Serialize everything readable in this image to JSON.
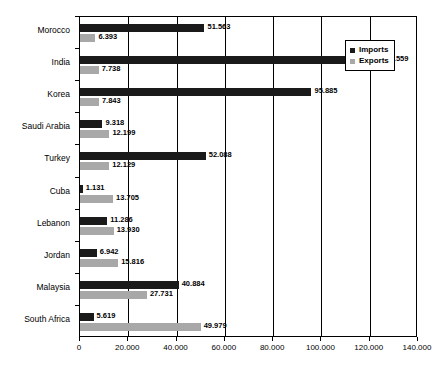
{
  "chart_data": {
    "type": "bar",
    "orientation": "horizontal",
    "title": "",
    "xlabel": "",
    "ylabel": "",
    "xlim": [
      0,
      140000
    ],
    "xticks": [
      0,
      20000,
      40000,
      60000,
      80000,
      100000,
      120000,
      140000
    ],
    "xtick_labels": [
      "0",
      "20.000",
      "40.000",
      "60.000",
      "80.000",
      "100.000",
      "120.000",
      "140.000"
    ],
    "grid": true,
    "legend_position": "top-right",
    "categories": [
      "Morocco",
      "India",
      "Korea",
      "Saudi Arabia",
      "Turkey",
      "Cuba",
      "Lebanon",
      "Jordan",
      "Malaysia",
      "South Africa"
    ],
    "series": [
      {
        "name": "Imports",
        "color": "#1a1a1a",
        "values": [
          51563,
          123559,
          95885,
          9318,
          52088,
          1131,
          11286,
          6942,
          40884,
          5619
        ],
        "labels": [
          "51.563",
          "123.559",
          "95.885",
          "9.318",
          "52.088",
          "1.131",
          "11.286",
          "6.942",
          "40.884",
          "5.619"
        ]
      },
      {
        "name": "Exports",
        "color": "#a8a8a8",
        "values": [
          6393,
          7738,
          7843,
          12199,
          12129,
          13705,
          13930,
          15816,
          27731,
          49979
        ],
        "labels": [
          "6.393",
          "7.738",
          "7.843",
          "12.199",
          "12.129",
          "13.705",
          "13.930",
          "15.816",
          "27.731",
          "49.979"
        ]
      }
    ]
  },
  "legend": {
    "items": [
      {
        "label": "Imports",
        "color": "#1a1a1a"
      },
      {
        "label": "Exports",
        "color": "#a8a8a8"
      }
    ]
  }
}
